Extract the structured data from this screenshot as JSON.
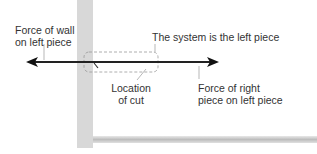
{
  "labels": {
    "wall_force_line1": "Force of wall",
    "wall_force_line2": "on left piece",
    "system": "The system is the left piece",
    "cut_line1": "Location",
    "cut_line2": "of cut",
    "right_force_line1": "Force of right",
    "right_force_line2": "piece on left piece"
  },
  "colors": {
    "wall": "#d6d6d6",
    "floor": "#c8c8c8",
    "arrow": "#222222",
    "dashed_box": "#999999",
    "text": "#333333"
  }
}
